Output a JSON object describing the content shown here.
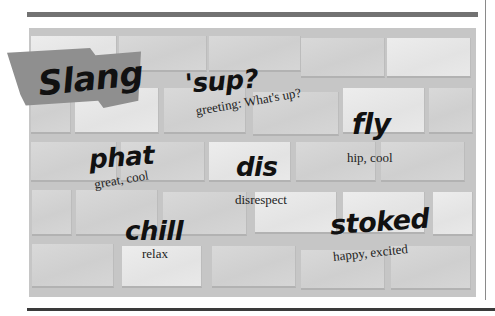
{
  "title": "Slang",
  "colors": {
    "top_bar": "#727272",
    "wall": "#c6c6c6",
    "banner": "#8f8f8f",
    "ink": "#111111"
  },
  "terms": [
    {
      "word": "'sup?",
      "meaning": "greeting: What's up?"
    },
    {
      "word": "fly",
      "meaning": "hip, cool"
    },
    {
      "word": "phat",
      "meaning": "great, cool"
    },
    {
      "word": "dis",
      "meaning": "disrespect"
    },
    {
      "word": "chill",
      "meaning": "relax"
    },
    {
      "word": "stoked",
      "meaning": "happy, excited"
    }
  ]
}
